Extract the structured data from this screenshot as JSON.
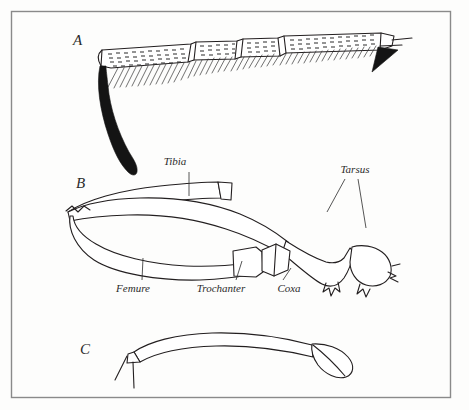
{
  "plate": {
    "background_color": "#fdfdfc",
    "ink_color": "#231f20",
    "frame_color": "#8a8a8a",
    "caption_style": "italic-serif"
  },
  "figures": [
    {
      "letter": "A",
      "name": "tarsus-with-spur",
      "description": "Setose tarsal segments with ventral bristle rows and a large dark curved apical spur"
    },
    {
      "letter": "B",
      "name": "complete-leg",
      "description": "Entire leg in lateral view showing coxa, trochanter, femure, tibia and tarsus"
    },
    {
      "letter": "C",
      "name": "simple-leg-segment",
      "description": "Slender curved segment with rounded distal article"
    }
  ],
  "labels": [
    {
      "name": "tibia",
      "text": "Tibia"
    },
    {
      "name": "tarsus",
      "text": "Tarsus"
    },
    {
      "name": "femure",
      "text": "Femure"
    },
    {
      "name": "trochanter",
      "text": "Trochanter"
    },
    {
      "name": "coxa",
      "text": "Coxa"
    }
  ]
}
